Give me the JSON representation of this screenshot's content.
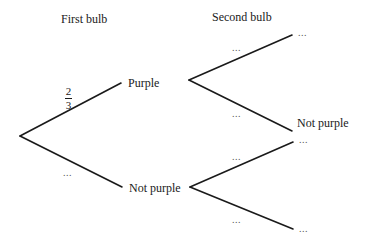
{
  "headers": {
    "first": "First bulb",
    "second": "Second bulb"
  },
  "first_level": {
    "upper": {
      "outcome": "Purple",
      "probability": {
        "numerator": "2",
        "denominator": "3"
      }
    },
    "lower": {
      "outcome": "Not purple",
      "probability": "..."
    }
  },
  "second_level": {
    "after_purple": {
      "upper": {
        "outcome": "...",
        "probability": "..."
      },
      "lower": {
        "outcome": "Not purple",
        "probability": "..."
      }
    },
    "after_not_purple": {
      "upper": {
        "outcome": "...",
        "probability": "..."
      },
      "lower": {
        "outcome": "...",
        "probability": "..."
      }
    }
  },
  "colors": {
    "line": "#1a1a1a",
    "text": "#1a1a1a",
    "background": "#ffffff"
  }
}
